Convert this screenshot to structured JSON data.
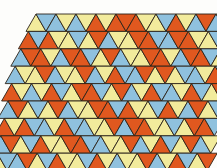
{
  "figure": {
    "name": "triangular-tessellation",
    "background_color": "#fdfdfb",
    "outline_color": "#2b2218",
    "outline_width": 0.9,
    "canvas": {
      "width": 217,
      "height": 168
    }
  },
  "palette": {
    "orange": "#e0581f",
    "blue": "#8fc1de",
    "yellow": "#f2eb9c",
    "names": [
      "orange",
      "blue",
      "yellow"
    ]
  },
  "geometry": {
    "triangle_width": 20.0,
    "triangle_height": 17.4,
    "rows": 9,
    "columns_per_row": 11,
    "row_shear_per_row": -1.6,
    "origin_x": 8.0,
    "origin_y": 14.0,
    "row_base_offsets": [
      18.0,
      12.0,
      6.0,
      2.0,
      0.0,
      -2.0,
      -4.0,
      -6.0,
      -8.0
    ]
  },
  "chart_data": {
    "type": "heatmap",
    "xlabel": "",
    "ylabel": "",
    "categories": [
      "orange",
      "blue",
      "yellow"
    ],
    "rows": [
      {
        "index": 0,
        "up": [
          "yellow",
          "blue",
          "blue",
          "orange",
          "orange",
          "orange",
          "yellow",
          "orange",
          "blue",
          "blue",
          "orange"
        ],
        "down": [
          "blue",
          "yellow",
          "yellow",
          "yellow",
          "orange",
          "yellow",
          "blue",
          "yellow",
          "orange",
          "yellow",
          "blue"
        ]
      },
      {
        "index": 1,
        "up": [
          "orange",
          "orange",
          "yellow",
          "yellow",
          "blue",
          "yellow",
          "orange",
          "blue",
          "orange",
          "yellow",
          "blue"
        ],
        "down": [
          "blue",
          "yellow",
          "blue",
          "orange",
          "yellow",
          "orange",
          "blue",
          "orange",
          "yellow",
          "blue",
          "yellow"
        ]
      },
      {
        "index": 2,
        "up": [
          "blue",
          "orange",
          "blue",
          "orange",
          "yellow",
          "blue",
          "yellow",
          "orange",
          "blue",
          "orange",
          "yellow"
        ],
        "down": [
          "orange",
          "yellow",
          "orange",
          "blue",
          "orange",
          "yellow",
          "orange",
          "yellow",
          "orange",
          "blue",
          "orange"
        ]
      },
      {
        "index": 3,
        "up": [
          "blue",
          "yellow",
          "blue",
          "yellow",
          "blue",
          "orange",
          "blue",
          "yellow",
          "yellow",
          "blue",
          "orange"
        ],
        "down": [
          "yellow",
          "orange",
          "yellow",
          "orange",
          "yellow",
          "blue",
          "orange",
          "orange",
          "blue",
          "yellow",
          "blue"
        ]
      },
      {
        "index": 4,
        "up": [
          "orange",
          "blue",
          "orange",
          "yellow",
          "orange",
          "yellow",
          "blue",
          "orange",
          "blue",
          "orange",
          "yellow"
        ],
        "down": [
          "yellow",
          "yellow",
          "blue",
          "orange",
          "blue",
          "orange",
          "yellow",
          "blue",
          "yellow",
          "blue",
          "orange"
        ]
      },
      {
        "index": 5,
        "up": [
          "blue",
          "yellow",
          "yellow",
          "blue",
          "yellow",
          "orange",
          "orange",
          "yellow",
          "orange",
          "blue",
          "yellow"
        ],
        "down": [
          "orange",
          "blue",
          "orange",
          "yellow",
          "orange",
          "blue",
          "yellow",
          "blue",
          "yellow",
          "orange",
          "blue"
        ]
      },
      {
        "index": 6,
        "up": [
          "orange",
          "orange",
          "blue",
          "orange",
          "blue",
          "yellow",
          "blue",
          "orange",
          "yellow",
          "yellow",
          "orange"
        ],
        "down": [
          "yellow",
          "blue",
          "yellow",
          "blue",
          "yellow",
          "orange",
          "orange",
          "yellow",
          "blue",
          "orange",
          "blue"
        ]
      },
      {
        "index": 7,
        "up": [
          "blue",
          "yellow",
          "orange",
          "yellow",
          "orange",
          "blue",
          "yellow",
          "blue",
          "orange",
          "yellow",
          "blue"
        ],
        "down": [
          "orange",
          "blue",
          "yellow",
          "orange",
          "blue",
          "yellow",
          "orange",
          "yellow",
          "blue",
          "orange",
          "yellow"
        ]
      },
      {
        "index": 8,
        "up": [
          "yellow",
          "blue",
          "yellow",
          "orange",
          "yellow",
          "orange",
          "blue",
          "yellow",
          "blue",
          "orange",
          "yellow"
        ],
        "down": [
          "blue",
          "orange",
          "blue",
          "yellow",
          "blue",
          "yellow",
          "yellow",
          "orange",
          "yellow",
          "blue",
          "orange"
        ]
      }
    ]
  }
}
